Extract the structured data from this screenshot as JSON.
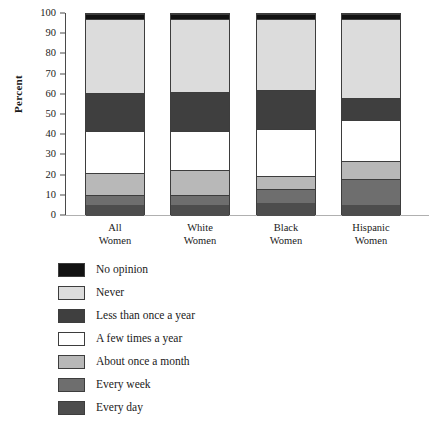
{
  "chart_data": {
    "type": "bar",
    "subtype": "stacked-percent",
    "title": "",
    "xlabel": "",
    "ylabel": "Percent",
    "ylim": [
      0,
      100
    ],
    "yticks": [
      0,
      10,
      20,
      30,
      40,
      50,
      60,
      70,
      80,
      90,
      100
    ],
    "ytick_labels": [
      "0",
      "10",
      "20",
      "30",
      "40",
      "50",
      "60",
      "70",
      "80",
      "90",
      "100"
    ],
    "grid": false,
    "legend_position": "below-plot-left",
    "categories": [
      "All Women",
      "White Women",
      "Black Women",
      "Hispanic Women"
    ],
    "category_lines": [
      [
        "All",
        "Women"
      ],
      [
        "White",
        "Women"
      ],
      [
        "Black",
        "Women"
      ],
      [
        "Hispanic",
        "Women"
      ]
    ],
    "series": [
      {
        "name": "Every day",
        "color": "#4d4d4d",
        "values": [
          5.5,
          5.5,
          6.5,
          5.5
        ]
      },
      {
        "name": "Every week",
        "color": "#6e6e6e",
        "values": [
          5.0,
          5.0,
          7.0,
          13.0
        ]
      },
      {
        "name": "About once a month",
        "color": "#b8b8b8",
        "values": [
          11.0,
          12.5,
          6.5,
          8.5
        ]
      },
      {
        "name": "A few times a year",
        "color": "#ffffff",
        "values": [
          20.5,
          19.0,
          23.0,
          20.5
        ]
      },
      {
        "name": "Less than once a year",
        "color": "#3f3f3f",
        "values": [
          19.0,
          19.5,
          19.5,
          11.0
        ]
      },
      {
        "name": "Never",
        "color": "#dcdcdc",
        "values": [
          36.5,
          36.0,
          35.0,
          39.0
        ]
      },
      {
        "name": "No opinion",
        "color": "#121212",
        "values": [
          2.5,
          2.5,
          2.5,
          2.5
        ]
      }
    ],
    "cumulative_tops": {
      "All Women": [
        5.5,
        10.5,
        21.5,
        42.0,
        61.0,
        97.5,
        100.0
      ],
      "White Women": [
        5.5,
        10.5,
        23.0,
        42.0,
        61.5,
        97.5,
        100.0
      ],
      "Black Women": [
        6.5,
        13.5,
        20.0,
        43.0,
        62.5,
        97.5,
        100.0
      ],
      "Hispanic Women": [
        5.5,
        18.5,
        27.0,
        47.5,
        58.5,
        97.5,
        100.0
      ]
    }
  },
  "legend": {
    "items": [
      {
        "label": "No opinion",
        "color": "#121212"
      },
      {
        "label": "Never",
        "color": "#dcdcdc"
      },
      {
        "label": "Less than once a year",
        "color": "#3f3f3f"
      },
      {
        "label": "A few times a year",
        "color": "#ffffff"
      },
      {
        "label": "About once a month",
        "color": "#b8b8b8"
      },
      {
        "label": "Every week",
        "color": "#6e6e6e"
      },
      {
        "label": "Every day",
        "color": "#4d4d4d"
      }
    ]
  },
  "axis": {
    "y_title": "Percent"
  }
}
